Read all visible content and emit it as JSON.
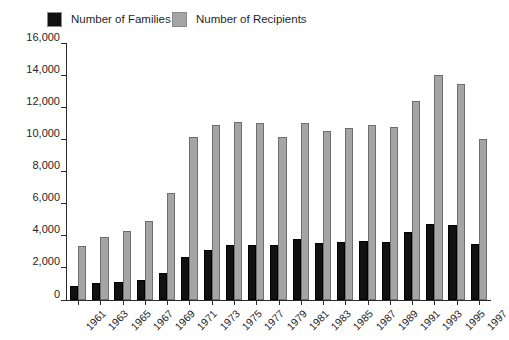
{
  "legend": {
    "position": "top-left",
    "entries": [
      {
        "label": "Number of Families",
        "color": "#111111",
        "key": "families"
      },
      {
        "label": "Number of Recipients",
        "color": "#a5a5a5",
        "key": "recipients"
      }
    ]
  },
  "axes": {
    "y_ticks": [
      "0",
      "2,000",
      "4,000",
      "6,000",
      "8,000",
      "10,000",
      "12,000",
      "14,000",
      "16,000"
    ]
  },
  "chart_data": {
    "type": "bar",
    "title": "",
    "subtitle": "",
    "xlabel": "",
    "ylabel": "",
    "grid": false,
    "legend_position": "top-left",
    "ylim": [
      0,
      16000
    ],
    "ytick_step": 2000,
    "categories": [
      "1961",
      "1963",
      "1965",
      "1967",
      "1969",
      "1971",
      "1973",
      "1975",
      "1977",
      "1979",
      "1981",
      "1983",
      "1985",
      "1987",
      "1989",
      "1991",
      "1993",
      "1995",
      "1997"
    ],
    "series": [
      {
        "name": "Number of Families",
        "color": "#111111",
        "values": [
          900,
          1050,
          1100,
          1250,
          1700,
          2650,
          3100,
          3450,
          3450,
          3400,
          3800,
          3550,
          3600,
          3650,
          3600,
          4250,
          4750,
          4700,
          3500
        ]
      },
      {
        "name": "Number of Recipients",
        "color": "#a5a5a5",
        "values": [
          3350,
          3900,
          4300,
          4950,
          6650,
          10150,
          10900,
          11100,
          11050,
          10150,
          11050,
          10500,
          10700,
          10900,
          10750,
          12400,
          14000,
          13450,
          10000
        ]
      }
    ]
  }
}
